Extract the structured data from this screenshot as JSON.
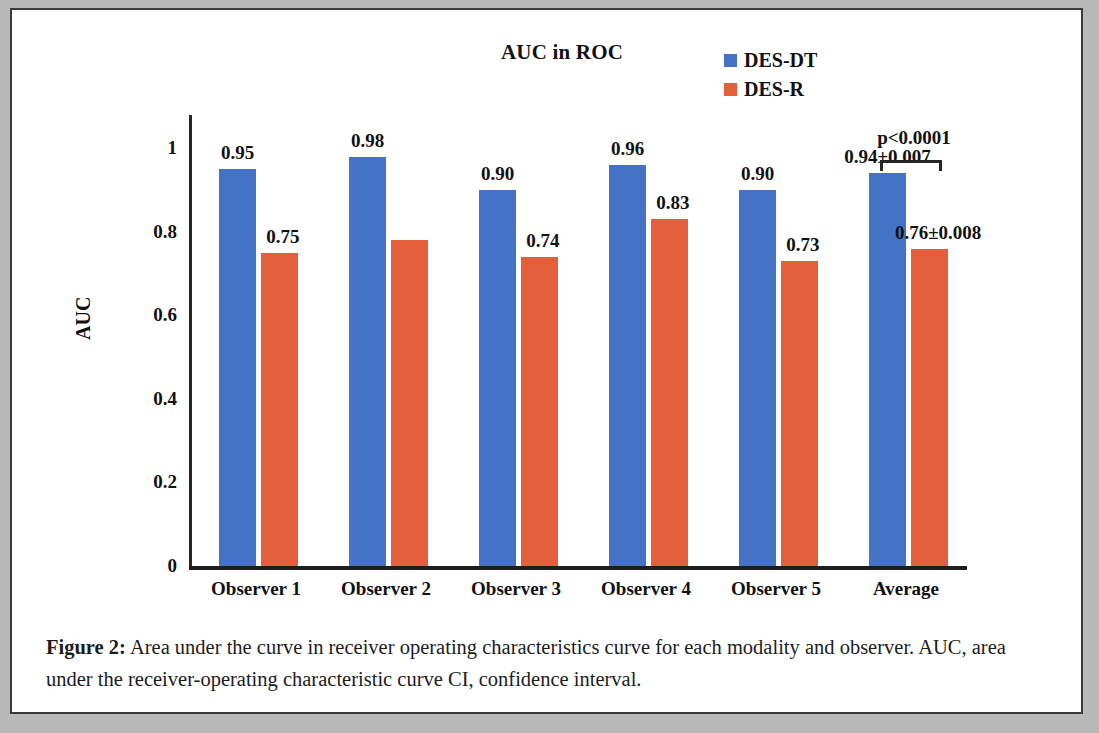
{
  "figure": {
    "caption_label": "Figure 2:",
    "caption_text": " Area under the curve in receiver operating characteristics curve for each modality and observer. AUC, area under the receiver-operating characteristic curve CI, confidence interval."
  },
  "chart_data": {
    "type": "bar",
    "title": "AUC in ROC",
    "xlabel": "",
    "ylabel": "AUC",
    "ylim": [
      0,
      1.08
    ],
    "yticks": [
      0,
      0.2,
      0.4,
      0.6,
      0.8,
      1
    ],
    "ytick_labels": [
      "0",
      "0.2",
      "0.4",
      "0.6",
      "0.8",
      "1"
    ],
    "grid": false,
    "legend_position": "top-right",
    "categories": [
      "Observer 1",
      "Observer 2",
      "Observer 3",
      "Observer 4",
      "Observer 5",
      "Average"
    ],
    "series": [
      {
        "name": "DES-DT",
        "color": "#4472C4",
        "values": [
          0.95,
          0.98,
          0.9,
          0.96,
          0.9,
          0.94
        ],
        "labels": [
          "0.95",
          "0.98",
          "0.90",
          "0.96",
          "0.90",
          "0.94±0.007"
        ]
      },
      {
        "name": "DES-R",
        "color": "#E4603D",
        "values": [
          0.75,
          0.78,
          0.74,
          0.83,
          0.73,
          0.76
        ],
        "labels": [
          "0.75",
          "",
          "0.74",
          "0.83",
          "0.73",
          "0.76±0.008"
        ]
      }
    ],
    "annotations": [
      {
        "name": "significance-bracket",
        "text": "p<0.0001",
        "from_category": "Average",
        "from_series": "DES-DT",
        "to_series": "DES-R"
      }
    ]
  }
}
